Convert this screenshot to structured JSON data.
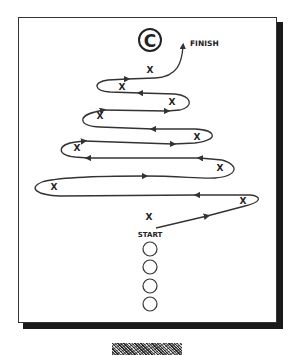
{
  "diagram": {
    "type": "zigzag-path-drill",
    "title_badge": {
      "letter": "C",
      "icon": "circle-letter-icon"
    },
    "labels": {
      "finish": "FINISH",
      "start": "START",
      "marker": "X"
    },
    "marker_count": 10,
    "start_circles": 4,
    "colors": {
      "line": "#333333",
      "frame_border": "#333333",
      "shadow": "#1a1a1a",
      "background": "#ffffff"
    }
  }
}
